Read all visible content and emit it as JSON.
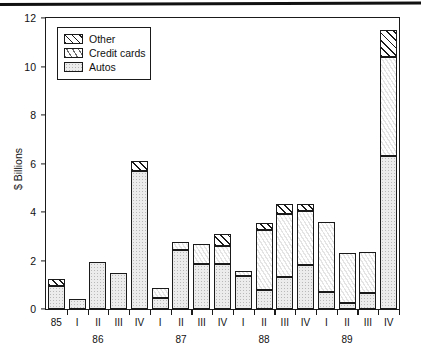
{
  "chart_data": {
    "type": "bar",
    "stacked": true,
    "title": "",
    "xlabel": "",
    "ylabel": "$ Billions",
    "ylim": [
      0,
      12
    ],
    "yticks": [
      0,
      2,
      4,
      6,
      8,
      10,
      12
    ],
    "ytick_labels": [
      "0",
      "2",
      "4",
      "6",
      "8",
      "10",
      "12"
    ],
    "grid": false,
    "legend_position": "upper-left-inside",
    "categories": [
      "85",
      "I",
      "II",
      "III",
      "IV",
      "I",
      "II",
      "III",
      "IV",
      "I",
      "II",
      "III",
      "IV",
      "I",
      "II",
      "III",
      "IV"
    ],
    "group_labels": [
      "",
      "86",
      "",
      "",
      "",
      "87",
      "",
      "",
      "",
      "88",
      "",
      "",
      "",
      "89",
      "",
      "",
      ""
    ],
    "group_axis": [
      {
        "label": "86",
        "center_index": 2
      },
      {
        "label": "87",
        "center_index": 6
      },
      {
        "label": "88",
        "center_index": 10
      },
      {
        "label": "89",
        "center_index": 14
      }
    ],
    "series": [
      {
        "name": "Autos",
        "values": [
          0.95,
          0.4,
          1.95,
          1.5,
          5.7,
          0.45,
          2.45,
          1.85,
          1.85,
          1.35,
          0.8,
          1.3,
          1.8,
          0.7,
          0.25,
          0.65,
          6.3
        ]
      },
      {
        "name": "Credit cards",
        "values": [
          0.0,
          0.0,
          0.0,
          0.0,
          0.0,
          0.4,
          0.3,
          0.85,
          0.75,
          0.2,
          2.45,
          2.6,
          2.25,
          2.9,
          2.05,
          1.7,
          4.1
        ]
      },
      {
        "name": "Other",
        "values": [
          0.3,
          0.0,
          0.0,
          0.0,
          0.4,
          0.0,
          0.0,
          0.0,
          0.5,
          0.0,
          0.3,
          0.45,
          0.3,
          0.0,
          0.0,
          0.0,
          1.1
        ]
      }
    ],
    "totals": [
      1.25,
      0.4,
      1.95,
      1.5,
      6.1,
      0.85,
      2.75,
      2.7,
      3.1,
      1.55,
      3.55,
      4.35,
      4.35,
      3.6,
      2.3,
      2.35,
      11.5
    ]
  },
  "legend": {
    "items": [
      {
        "label": "Other",
        "pattern": "diagonal-hatch"
      },
      {
        "label": "Credit cards",
        "pattern": "speckle"
      },
      {
        "label": "Autos",
        "pattern": "gray-stipple"
      }
    ]
  },
  "colors": {
    "axis": "#1a1a1a",
    "autos_fill": "#ececec",
    "credit_fill": "#ffffff",
    "other_fill": "#ffffff",
    "text": "#111111"
  }
}
